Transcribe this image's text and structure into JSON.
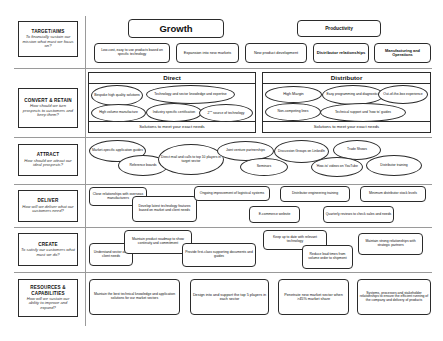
{
  "diagram": {
    "row_labels": [
      {
        "head": "TARGET/AIMS",
        "sub": "To financially sustain our mission what must we focus on?"
      },
      {
        "head": "CONVERT & RETAIN",
        "sub": "How should we turn prospects to customers and keep them?"
      },
      {
        "head": "ATTRACT",
        "sub": "How should we attract our ideal prospects?"
      },
      {
        "head": "DELIVER",
        "sub": "How will we deliver what our customers need?"
      },
      {
        "head": "CREATE",
        "sub": "To satisfy our customers what must we do?"
      },
      {
        "head": "RESOURCES & CAPABILITIES",
        "sub": "How will we sustain our ability to improve and expand?"
      }
    ],
    "pillars": [
      {
        "name": "Growth"
      },
      {
        "name": "Productivity"
      }
    ],
    "target_items": [
      "Low-cost, easy to use products based on specific technology",
      "Expansion into new markets",
      "New product development",
      "Distributor relationships",
      "Manufacturing and Operations"
    ],
    "convert": {
      "left_header": "Direct",
      "right_header": "Distributor",
      "left_items": [
        "Bespoke high quality solutions",
        "Technology and sector knowledge and expertise",
        "High volume manufacture",
        "Industry specific certification",
        "2nd source of technology"
      ],
      "right_items": [
        "High Margin",
        "Easy programming and diagnostics",
        "Out-of-the-box experience",
        "Non-competing lines",
        "Technical support and 'how to' guides"
      ],
      "left_footer": "Solutions to meet your exact needs",
      "right_footer": "Solutions to meet your exact needs"
    },
    "attract_items": [
      "Market-specific application guides",
      "Reference boards",
      "Direct mail and calls to top 10 players in target sector",
      "Joint venture partnerships",
      "Seminars",
      "Discussion Groups on LinkedIn",
      "Trade Shows",
      "'How-to' videos on YouTube",
      "Distributor training"
    ],
    "deliver_items": [
      "Close relationships with overseas manufacturers",
      "Develop latest technology features based on market and client needs",
      "Ongoing improvement of logistical systems",
      "Distributor engineering training",
      "Minimum distributor stock levels",
      "E-commerce website",
      "Quarterly reviews to check sales and needs"
    ],
    "create_items": [
      "Understand sector and client needs",
      "Maintain product roadmap to show continuity and commitment",
      "Provide first-class supporting documents and guides",
      "Keep up to date with relevant technology",
      "Reduce lead times from volume order to shipment",
      "Maintain strong relationships with strategic partners"
    ],
    "resources_items": [
      "Maintain the best technical knowledge and application solutions for our market sectors",
      "Design into and support the top 5 players in each sector",
      "Penetrate new market sector when >45% market share",
      "Systems, processes and stakeholder relationships to ensure the efficient running of the company and delivery of products"
    ],
    "colors": {
      "line": "#2b2b2b",
      "divider": "#9a9a9a",
      "background": "#ffffff"
    }
  }
}
